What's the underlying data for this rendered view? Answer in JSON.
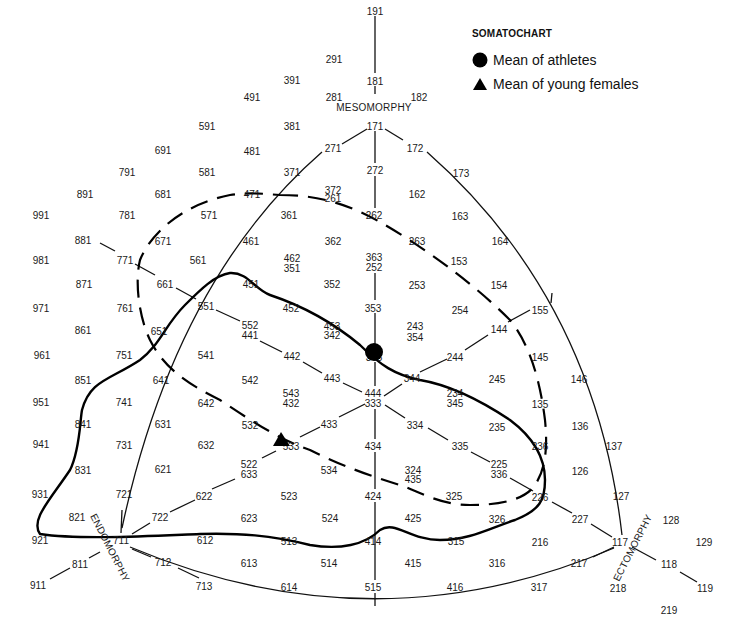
{
  "legend": {
    "title": "SOMATOCHART",
    "items": [
      {
        "symbol": "circle",
        "label": "Mean of athletes",
        "color": "#000000"
      },
      {
        "symbol": "triangle",
        "label": "Mean of young females",
        "color": "#000000"
      }
    ]
  },
  "axes": {
    "mesomorphy": "MESOMORPHY",
    "endomorphy": "ENDOMORPHY",
    "ectomorphy": "ECTOMORPHY"
  },
  "chart_data": {
    "type": "scatter",
    "title": "SOMATOCHART",
    "axes": [
      "MESOMORPHY",
      "ENDOMORPHY",
      "ECTOMORPHY"
    ],
    "series": [
      {
        "name": "Mean of athletes",
        "marker": "circle",
        "x": 374,
        "y": 352,
        "near_label": "343"
      },
      {
        "name": "Mean of young females",
        "marker": "triangle",
        "x": 281,
        "y": 440,
        "near_label": "533"
      }
    ],
    "grid_labels": [
      {
        "t": "191",
        "x": 375,
        "y": 11
      },
      {
        "t": "291",
        "x": 334,
        "y": 59
      },
      {
        "t": "181",
        "x": 375,
        "y": 81
      },
      {
        "t": "391",
        "x": 292,
        "y": 80
      },
      {
        "t": "491",
        "x": 252,
        "y": 97
      },
      {
        "t": "281",
        "x": 334,
        "y": 97
      },
      {
        "t": "182",
        "x": 419,
        "y": 97
      },
      {
        "t": "591",
        "x": 207,
        "y": 126
      },
      {
        "t": "381",
        "x": 292,
        "y": 126
      },
      {
        "t": "171",
        "x": 375,
        "y": 126
      },
      {
        "t": "691",
        "x": 163,
        "y": 150
      },
      {
        "t": "481",
        "x": 252,
        "y": 151
      },
      {
        "t": "271",
        "x": 333,
        "y": 148
      },
      {
        "t": "172",
        "x": 415,
        "y": 148
      },
      {
        "t": "791",
        "x": 127,
        "y": 172
      },
      {
        "t": "581",
        "x": 207,
        "y": 172
      },
      {
        "t": "371",
        "x": 292,
        "y": 172
      },
      {
        "t": "272",
        "x": 375,
        "y": 170
      },
      {
        "t": "173",
        "x": 461,
        "y": 173
      },
      {
        "t": "891",
        "x": 85,
        "y": 194
      },
      {
        "t": "681",
        "x": 163,
        "y": 194
      },
      {
        "t": "471",
        "x": 252,
        "y": 194
      },
      {
        "t": "372",
        "x": 333,
        "y": 190
      },
      {
        "t": "261",
        "x": 333,
        "y": 198
      },
      {
        "t": "162",
        "x": 417,
        "y": 194
      },
      {
        "t": "991",
        "x": 41,
        "y": 215
      },
      {
        "t": "781",
        "x": 127,
        "y": 215
      },
      {
        "t": "571",
        "x": 209,
        "y": 215
      },
      {
        "t": "361",
        "x": 289,
        "y": 215
      },
      {
        "t": "262",
        "x": 374,
        "y": 215
      },
      {
        "t": "163",
        "x": 460,
        "y": 216
      },
      {
        "t": "881",
        "x": 83,
        "y": 240
      },
      {
        "t": "671",
        "x": 163,
        "y": 241
      },
      {
        "t": "461",
        "x": 251,
        "y": 241
      },
      {
        "t": "362",
        "x": 333,
        "y": 241
      },
      {
        "t": "263",
        "x": 417,
        "y": 241
      },
      {
        "t": "164",
        "x": 500,
        "y": 241
      },
      {
        "t": "981",
        "x": 41,
        "y": 260
      },
      {
        "t": "771",
        "x": 125,
        "y": 260
      },
      {
        "t": "561",
        "x": 198,
        "y": 260
      },
      {
        "t": "462",
        "x": 292,
        "y": 258
      },
      {
        "t": "351",
        "x": 292,
        "y": 268
      },
      {
        "t": "363",
        "x": 374,
        "y": 257
      },
      {
        "t": "252",
        "x": 374,
        "y": 267
      },
      {
        "t": "153",
        "x": 459,
        "y": 261
      },
      {
        "t": "871",
        "x": 84,
        "y": 284
      },
      {
        "t": "661",
        "x": 165,
        "y": 284
      },
      {
        "t": "451",
        "x": 251,
        "y": 284
      },
      {
        "t": "352",
        "x": 332,
        "y": 284
      },
      {
        "t": "253",
        "x": 417,
        "y": 285
      },
      {
        "t": "154",
        "x": 499,
        "y": 285
      },
      {
        "t": "971",
        "x": 41,
        "y": 308
      },
      {
        "t": "761",
        "x": 125,
        "y": 308
      },
      {
        "t": "551",
        "x": 206,
        "y": 306
      },
      {
        "t": "452",
        "x": 291,
        "y": 308
      },
      {
        "t": "353",
        "x": 373,
        "y": 308
      },
      {
        "t": "254",
        "x": 460,
        "y": 310
      },
      {
        "t": "155",
        "x": 540,
        "y": 310
      },
      {
        "t": "861",
        "x": 83,
        "y": 330
      },
      {
        "t": "651",
        "x": 159,
        "y": 331
      },
      {
        "t": "552",
        "x": 250,
        "y": 325
      },
      {
        "t": "441",
        "x": 250,
        "y": 335
      },
      {
        "t": "453",
        "x": 332,
        "y": 326
      },
      {
        "t": "342",
        "x": 332,
        "y": 335
      },
      {
        "t": "243",
        "x": 415,
        "y": 326
      },
      {
        "t": "354",
        "x": 415,
        "y": 337
      },
      {
        "t": "144",
        "x": 499,
        "y": 329
      },
      {
        "t": "961",
        "x": 42,
        "y": 355
      },
      {
        "t": "751",
        "x": 124,
        "y": 355
      },
      {
        "t": "541",
        "x": 206,
        "y": 355
      },
      {
        "t": "442",
        "x": 292,
        "y": 356
      },
      {
        "t": "343",
        "x": 374,
        "y": 357
      },
      {
        "t": "244",
        "x": 455,
        "y": 357
      },
      {
        "t": "145",
        "x": 540,
        "y": 357
      },
      {
        "t": "851",
        "x": 83,
        "y": 380
      },
      {
        "t": "641",
        "x": 161,
        "y": 380
      },
      {
        "t": "542",
        "x": 250,
        "y": 380
      },
      {
        "t": "443",
        "x": 332,
        "y": 378
      },
      {
        "t": "344",
        "x": 412,
        "y": 378
      },
      {
        "t": "245",
        "x": 497,
        "y": 379
      },
      {
        "t": "146",
        "x": 579,
        "y": 379
      },
      {
        "t": "951",
        "x": 41,
        "y": 402
      },
      {
        "t": "741",
        "x": 124,
        "y": 402
      },
      {
        "t": "642",
        "x": 206,
        "y": 403
      },
      {
        "t": "543",
        "x": 291,
        "y": 393
      },
      {
        "t": "432",
        "x": 291,
        "y": 403
      },
      {
        "t": "444",
        "x": 373,
        "y": 393
      },
      {
        "t": "333",
        "x": 373,
        "y": 403
      },
      {
        "t": "234",
        "x": 455,
        "y": 393
      },
      {
        "t": "345",
        "x": 455,
        "y": 403
      },
      {
        "t": "135",
        "x": 540,
        "y": 404
      },
      {
        "t": "841",
        "x": 83,
        "y": 424
      },
      {
        "t": "631",
        "x": 163,
        "y": 424
      },
      {
        "t": "532",
        "x": 250,
        "y": 425
      },
      {
        "t": "433",
        "x": 329,
        "y": 424
      },
      {
        "t": "334",
        "x": 415,
        "y": 425
      },
      {
        "t": "235",
        "x": 497,
        "y": 427
      },
      {
        "t": "136",
        "x": 580,
        "y": 426
      },
      {
        "t": "941",
        "x": 41,
        "y": 444
      },
      {
        "t": "731",
        "x": 124,
        "y": 445
      },
      {
        "t": "632",
        "x": 206,
        "y": 445
      },
      {
        "t": "533",
        "x": 291,
        "y": 446
      },
      {
        "t": "434",
        "x": 373,
        "y": 446
      },
      {
        "t": "335",
        "x": 460,
        "y": 446
      },
      {
        "t": "236",
        "x": 540,
        "y": 446
      },
      {
        "t": "137",
        "x": 614,
        "y": 446
      },
      {
        "t": "831",
        "x": 83,
        "y": 470
      },
      {
        "t": "621",
        "x": 163,
        "y": 469
      },
      {
        "t": "522",
        "x": 249,
        "y": 464
      },
      {
        "t": "633",
        "x": 249,
        "y": 474
      },
      {
        "t": "534",
        "x": 329,
        "y": 470
      },
      {
        "t": "324",
        "x": 413,
        "y": 470
      },
      {
        "t": "435",
        "x": 413,
        "y": 479
      },
      {
        "t": "225",
        "x": 499,
        "y": 464
      },
      {
        "t": "336",
        "x": 499,
        "y": 474
      },
      {
        "t": "126",
        "x": 580,
        "y": 471
      },
      {
        "t": "931",
        "x": 40,
        "y": 494
      },
      {
        "t": "721",
        "x": 124,
        "y": 494
      },
      {
        "t": "622",
        "x": 204,
        "y": 496
      },
      {
        "t": "523",
        "x": 289,
        "y": 496
      },
      {
        "t": "424",
        "x": 373,
        "y": 496
      },
      {
        "t": "325",
        "x": 454,
        "y": 496
      },
      {
        "t": "226",
        "x": 540,
        "y": 497
      },
      {
        "t": "127",
        "x": 621,
        "y": 496
      },
      {
        "t": "821",
        "x": 77,
        "y": 517
      },
      {
        "t": "722",
        "x": 160,
        "y": 517
      },
      {
        "t": "623",
        "x": 249,
        "y": 518
      },
      {
        "t": "524",
        "x": 330,
        "y": 518
      },
      {
        "t": "425",
        "x": 413,
        "y": 518
      },
      {
        "t": "326",
        "x": 497,
        "y": 519
      },
      {
        "t": "227",
        "x": 580,
        "y": 519
      },
      {
        "t": "128",
        "x": 671,
        "y": 520
      },
      {
        "t": "921",
        "x": 40,
        "y": 540
      },
      {
        "t": "711",
        "x": 121,
        "y": 540
      },
      {
        "t": "612",
        "x": 205,
        "y": 540
      },
      {
        "t": "513",
        "x": 289,
        "y": 541
      },
      {
        "t": "414",
        "x": 373,
        "y": 541
      },
      {
        "t": "315",
        "x": 456,
        "y": 541
      },
      {
        "t": "216",
        "x": 540,
        "y": 542
      },
      {
        "t": "117",
        "x": 620,
        "y": 542
      },
      {
        "t": "129",
        "x": 704,
        "y": 542
      },
      {
        "t": "811",
        "x": 80,
        "y": 564
      },
      {
        "t": "712",
        "x": 163,
        "y": 562
      },
      {
        "t": "613",
        "x": 249,
        "y": 563
      },
      {
        "t": "514",
        "x": 329,
        "y": 563
      },
      {
        "t": "415",
        "x": 413,
        "y": 563
      },
      {
        "t": "316",
        "x": 497,
        "y": 563
      },
      {
        "t": "217",
        "x": 579,
        "y": 563
      },
      {
        "t": "118",
        "x": 669,
        "y": 564
      },
      {
        "t": "911",
        "x": 38,
        "y": 585
      },
      {
        "t": "713",
        "x": 204,
        "y": 586
      },
      {
        "t": "614",
        "x": 289,
        "y": 587
      },
      {
        "t": "515",
        "x": 373,
        "y": 587
      },
      {
        "t": "416",
        "x": 455,
        "y": 587
      },
      {
        "t": "317",
        "x": 539,
        "y": 587
      },
      {
        "t": "218",
        "x": 618,
        "y": 588
      },
      {
        "t": "119",
        "x": 705,
        "y": 588
      },
      {
        "t": "219",
        "x": 669,
        "y": 610
      }
    ]
  }
}
